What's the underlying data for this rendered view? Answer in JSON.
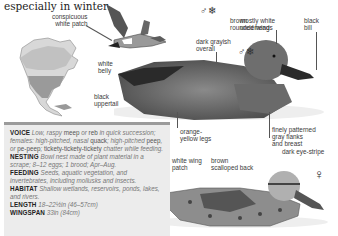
{
  "intro_text": "especially in winter.",
  "male_flight": {
    "symbol": "♂❄",
    "labels": {
      "white_patch": "conspicuous\nwhite patch",
      "underwings": "mostly white\nunderwings",
      "belly": "white\nbelly"
    }
  },
  "male": {
    "symbol": "♂❄",
    "labels": {
      "overall": "dark grayish\noverall",
      "head": "brown\nrounded head",
      "bill": "black\nbill",
      "uppertail": "black\nuppertail",
      "legs": "orange-\nyellow legs",
      "flanks": "finely patterned\ngray flanks\nand breast"
    }
  },
  "female": {
    "symbol": "♀",
    "labels": {
      "wing_patch": "white wing\npatch",
      "back": "brown\nscalloped back",
      "eye_stripe": "dark eye-stripe"
    }
  },
  "map": {
    "name": "range-map-north-america"
  },
  "info": {
    "voice": {
      "label": "VOICE",
      "text_parts": [
        "Low, raspy ",
        "meep",
        " or ",
        "reb",
        " in quick succession; females: high-pitched, nasal ",
        "quack",
        "; high-pitched ",
        "peep",
        ", or ",
        "pe-peep",
        "; ",
        "tickety-tickety-tickety",
        " chatter while feeding."
      ]
    },
    "nesting": {
      "label": "NESTING",
      "text": "Bowl nest made of plant material in a scrape; 8–12 eggs; 1 brood; Apr–Aug."
    },
    "feeding": {
      "label": "FEEDING",
      "text": "Seeds, aquatic vegetation, and invertebrates, including mollusks and insects."
    },
    "habitat": {
      "label": "HABITAT",
      "text": "Shallow wetlands, reservoirs, ponds, lakes, and rivers."
    },
    "length": {
      "label": "LENGTH",
      "text": "18–22½in (46–57cm)"
    },
    "wingspan": {
      "label": "WINGSPAN",
      "text": "33in (84cm)"
    }
  }
}
